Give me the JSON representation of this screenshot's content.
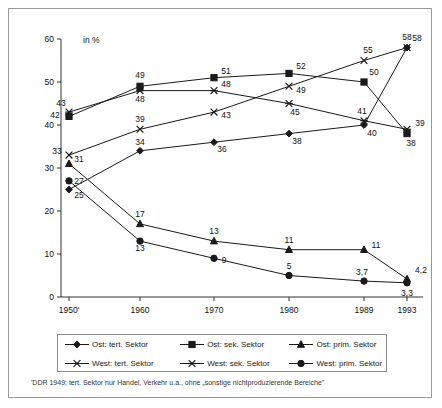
{
  "axis": {
    "unit_label": "in %",
    "y_ticks": [
      "0",
      "10",
      "20",
      "30",
      "40",
      "50",
      "60"
    ],
    "y_tick_values": [
      0,
      10,
      20,
      30,
      40,
      50,
      60
    ],
    "x_ticks": [
      "1950'",
      "1960",
      "1970",
      "1980",
      "1989",
      "1993"
    ]
  },
  "legend": {
    "items": [
      {
        "label": "Ost: tert. Sektor",
        "marker": "diamond-marker-icon",
        "color": "#1a1a1a"
      },
      {
        "label": "Ost: sek. Sektor",
        "marker": "square-marker-icon",
        "color": "#1a1a1a"
      },
      {
        "label": "Ost: prim. Sektor",
        "marker": "triangle-marker-icon",
        "color": "#1a1a1a"
      },
      {
        "label": "West: tert. Sektor",
        "marker": "cross-marker-icon",
        "color": "#1a1a1a"
      },
      {
        "label": "West: sek. Sektor",
        "marker": "asterisk-marker-icon",
        "color": "#1a1a1a"
      },
      {
        "label": "West: prim. Sektor",
        "marker": "circle-marker-icon",
        "color": "#1a1a1a"
      }
    ]
  },
  "footnote": "'DDR 1949; tert. Sektor nur Handel, Verkehr u.a., ohne „sonstige nichtproduzierende Bereiche\"",
  "chart_data": {
    "type": "line",
    "title": "",
    "xlabel": "",
    "ylabel": "in %",
    "ylim": [
      0,
      60
    ],
    "grid": false,
    "legend_position": "bottom",
    "categories": [
      "1950'",
      "1960",
      "1970",
      "1980",
      "1989",
      "1993"
    ],
    "x_positions": [
      1950,
      1960,
      1970,
      1980,
      1989,
      1993
    ],
    "series": [
      {
        "name": "Ost: tert. Sektor",
        "marker": "diamond",
        "values": [
          25,
          34,
          36,
          38,
          40,
          58
        ],
        "labels": [
          "25",
          "34",
          "36",
          "38",
          "40",
          "58"
        ]
      },
      {
        "name": "Ost: sek. Sektor",
        "marker": "square",
        "values": [
          42,
          49,
          51,
          52,
          50,
          38
        ],
        "labels": [
          "42",
          "49",
          "51",
          "52",
          "50",
          "38"
        ]
      },
      {
        "name": "Ost: prim. Sektor",
        "marker": "triangle",
        "values": [
          31,
          17,
          13,
          11,
          11,
          4.2
        ],
        "labels": [
          "31",
          "17",
          "13",
          "11",
          "11",
          "4,2"
        ]
      },
      {
        "name": "West: tert. Sektor",
        "marker": "cross",
        "values": [
          33,
          39,
          43,
          49,
          55,
          58
        ],
        "labels": [
          "33",
          "39",
          "43",
          "49",
          "55",
          "58"
        ]
      },
      {
        "name": "West: sek. Sektor",
        "marker": "asterisk",
        "values": [
          43,
          48,
          48,
          45,
          41,
          39
        ],
        "labels": [
          "43",
          "48",
          "48",
          "45",
          "41",
          "39"
        ]
      },
      {
        "name": "West: prim. Sektor",
        "marker": "circle",
        "values": [
          27,
          13,
          9,
          5,
          3.7,
          3.3
        ],
        "labels": [
          "27",
          "13",
          "9",
          "5",
          "3,7",
          "3,3"
        ]
      }
    ],
    "label_offsets": {
      "Ost: tert. Sektor": [
        [
          10,
          8
        ],
        [
          0,
          -6
        ],
        [
          8,
          10
        ],
        [
          8,
          10
        ],
        [
          8,
          11
        ],
        [
          0,
          -8
        ]
      ],
      "Ost: sek. Sektor": [
        [
          -14,
          2
        ],
        [
          0,
          -8
        ],
        [
          12,
          -4
        ],
        [
          12,
          -4
        ],
        [
          10,
          -7
        ],
        [
          4,
          12
        ]
      ],
      "Ost: prim. Sektor": [
        [
          10,
          -2
        ],
        [
          0,
          -7
        ],
        [
          0,
          -7
        ],
        [
          0,
          -7
        ],
        [
          12,
          -2
        ],
        [
          14,
          -6
        ]
      ],
      "West: tert. Sektor": [
        [
          -12,
          -1
        ],
        [
          0,
          -7
        ],
        [
          12,
          6
        ],
        [
          12,
          7
        ],
        [
          4,
          -8
        ],
        [
          10,
          -7
        ]
      ],
      "West: sek. Sektor": [
        [
          -8,
          -6
        ],
        [
          0,
          11
        ],
        [
          12,
          -4
        ],
        [
          6,
          11
        ],
        [
          -2,
          -7
        ],
        [
          13,
          -3
        ]
      ],
      "West: prim. Sektor": [
        [
          10,
          3
        ],
        [
          0,
          10
        ],
        [
          10,
          5
        ],
        [
          0,
          -7
        ],
        [
          -2,
          -6
        ],
        [
          0,
          13
        ]
      ]
    }
  }
}
